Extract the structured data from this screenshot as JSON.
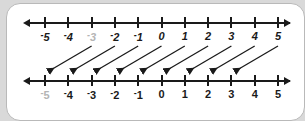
{
  "diagram": {
    "axis_min": -5,
    "axis_max": 5,
    "tick_step": 1,
    "line_color": "#1a1a1a",
    "faded_color": "#b4b4b4",
    "card_bg": "#ffffff",
    "page_bg": "#d9d9d9"
  },
  "top_line": {
    "name": "top-number-line",
    "negative_sign": "-",
    "labels": [
      {
        "value": -5,
        "text": "5",
        "negative": true,
        "faded": false
      },
      {
        "value": -4,
        "text": "4",
        "negative": true,
        "faded": false
      },
      {
        "value": -3,
        "text": "3",
        "negative": true,
        "faded": true
      },
      {
        "value": -2,
        "text": "2",
        "negative": true,
        "faded": false
      },
      {
        "value": -1,
        "text": "1",
        "negative": true,
        "faded": false
      },
      {
        "value": 0,
        "text": "0",
        "negative": false,
        "faded": false
      },
      {
        "value": 1,
        "text": "1",
        "negative": false,
        "faded": false
      },
      {
        "value": 2,
        "text": "2",
        "negative": false,
        "faded": false
      },
      {
        "value": 3,
        "text": "3",
        "negative": false,
        "faded": false
      },
      {
        "value": 4,
        "text": "4",
        "negative": false,
        "faded": false
      },
      {
        "value": 5,
        "text": "5",
        "negative": false,
        "faded": false
      }
    ]
  },
  "bottom_line": {
    "name": "bottom-number-line",
    "negative_sign": "-",
    "labels": [
      {
        "value": -5,
        "text": "5",
        "negative": true,
        "faded": true
      },
      {
        "value": -4,
        "text": "4",
        "negative": true,
        "faded": false
      },
      {
        "value": -3,
        "text": "3",
        "negative": true,
        "faded": false
      },
      {
        "value": -2,
        "text": "2",
        "negative": true,
        "faded": false
      },
      {
        "value": -1,
        "text": "1",
        "negative": true,
        "faded": false
      },
      {
        "value": 0,
        "text": "0",
        "negative": false,
        "faded": false
      },
      {
        "value": 1,
        "text": "1",
        "negative": false,
        "faded": false
      },
      {
        "value": 2,
        "text": "2",
        "negative": false,
        "faded": false
      },
      {
        "value": 3,
        "text": "3",
        "negative": false,
        "faded": false
      },
      {
        "value": 4,
        "text": "4",
        "negative": false,
        "faded": false
      },
      {
        "value": 5,
        "text": "5",
        "negative": false,
        "faded": false
      }
    ]
  },
  "mapping_arrows": {
    "name": "mapping-arrows",
    "shift": -2,
    "count": 9,
    "items": [
      {
        "from": -3,
        "to": -5
      },
      {
        "from": -2,
        "to": -4
      },
      {
        "from": -1,
        "to": -3
      },
      {
        "from": 0,
        "to": -2
      },
      {
        "from": 1,
        "to": -1
      },
      {
        "from": 2,
        "to": 0
      },
      {
        "from": 3,
        "to": 1
      },
      {
        "from": 4,
        "to": 2
      },
      {
        "from": 5,
        "to": 3
      }
    ]
  }
}
